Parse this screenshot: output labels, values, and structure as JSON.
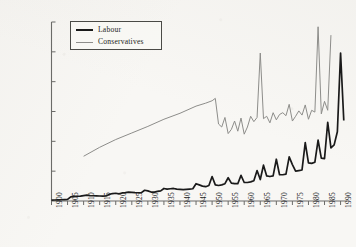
{
  "chart_data": {
    "type": "line",
    "title": "",
    "subtitle": "",
    "xlabel": "",
    "ylabel": "",
    "xlim": [
      1900,
      1992
    ],
    "ylim": [
      0,
      30000
    ],
    "grid": false,
    "legend_position": "top-left",
    "y_ticks": [
      0,
      5000,
      10000,
      15000,
      20000,
      25000,
      30000
    ],
    "y_tick_labels": [
      "0",
      "5,000",
      "10,000",
      "15,000",
      "20,000",
      "25,000",
      "30,000"
    ],
    "x_ticks": [
      1900,
      1905,
      1910,
      1915,
      1920,
      1925,
      1930,
      1935,
      1940,
      1945,
      1950,
      1955,
      1960,
      1965,
      1970,
      1975,
      1980,
      1985,
      1990
    ],
    "x_tick_labels": [
      "1900",
      "1905",
      "1910",
      "1915",
      "1920",
      "1925",
      "1930",
      "1935",
      "1940",
      "1945",
      "1950",
      "1955",
      "1960",
      "1965",
      "1970",
      "1975",
      "1980",
      "1985",
      "1990"
    ],
    "legend": [
      "Labour",
      "Conservatives"
    ],
    "series": [
      {
        "name": "Labour",
        "color": "#1a1a1a",
        "width": 1.7,
        "x": [
          1900,
          1901,
          1902,
          1903,
          1904,
          1905,
          1906,
          1907,
          1908,
          1909,
          1910,
          1911,
          1912,
          1913,
          1914,
          1915,
          1916,
          1917,
          1918,
          1919,
          1920,
          1921,
          1922,
          1923,
          1924,
          1925,
          1926,
          1927,
          1928,
          1929,
          1930,
          1931,
          1932,
          1933,
          1934,
          1935,
          1936,
          1937,
          1938,
          1939,
          1940,
          1941,
          1942,
          1943,
          1944,
          1945,
          1946,
          1947,
          1948,
          1949,
          1950,
          1951,
          1952,
          1953,
          1954,
          1955,
          1956,
          1957,
          1958,
          1959,
          1960,
          1961,
          1962,
          1963,
          1964,
          1965,
          1966,
          1967,
          1968,
          1969,
          1970,
          1971,
          1972,
          1973,
          1974,
          1975,
          1976,
          1977,
          1978,
          1979,
          1980,
          1981,
          1982,
          1983,
          1984,
          1985,
          1986,
          1987,
          1988,
          1989,
          1990,
          1991
        ],
        "values": [
          150,
          170,
          190,
          210,
          230,
          260,
          700,
          760,
          800,
          820,
          900,
          980,
          900,
          880,
          860,
          840,
          830,
          860,
          1100,
          1250,
          1300,
          1200,
          1350,
          1400,
          1500,
          1450,
          1400,
          1380,
          1400,
          1800,
          1700,
          1500,
          1500,
          1600,
          1700,
          2100,
          2000,
          2050,
          2100,
          2000,
          1950,
          1900,
          1950,
          2000,
          2050,
          2900,
          2700,
          2500,
          2400,
          2600,
          4100,
          2700,
          2600,
          2700,
          2900,
          3900,
          3000,
          2900,
          2900,
          4300,
          3100,
          3100,
          3200,
          3400,
          5100,
          3600,
          6000,
          4200,
          4100,
          4200,
          7000,
          4400,
          4400,
          4500,
          7400,
          6100,
          5000,
          5100,
          5200,
          9800,
          6400,
          6300,
          6500,
          10200,
          7200,
          7100,
          13200,
          8900,
          9400,
          11600,
          24800,
          13500
        ]
      },
      {
        "name": "Conservatives",
        "color": "#8d8d8a",
        "width": 1.0,
        "x": [
          1910,
          1915,
          1920,
          1925,
          1930,
          1935,
          1940,
          1945,
          1948,
          1950,
          1951,
          1952,
          1953,
          1954,
          1955,
          1956,
          1957,
          1958,
          1959,
          1960,
          1961,
          1962,
          1963,
          1964,
          1965,
          1966,
          1967,
          1968,
          1969,
          1970,
          1971,
          1972,
          1973,
          1974,
          1975,
          1976,
          1977,
          1978,
          1979,
          1980,
          1981,
          1982,
          1983,
          1984,
          1985,
          1986,
          1987
        ],
        "values": [
          7500,
          9000,
          10300,
          11400,
          12500,
          13700,
          14700,
          15900,
          16400,
          16800,
          17200,
          12900,
          12400,
          14000,
          11300,
          12000,
          13400,
          11700,
          13900,
          11200,
          12400,
          14200,
          13300,
          14000,
          24800,
          13800,
          14200,
          13100,
          14800,
          13600,
          14500,
          14800,
          14300,
          16200,
          13400,
          14200,
          15100,
          14400,
          16100,
          13700,
          15200,
          14900,
          29200,
          14600,
          16700,
          15200,
          27800
        ]
      }
    ]
  },
  "legend": {
    "labour_label": "Labour",
    "conservatives_label": "Conservatives"
  }
}
